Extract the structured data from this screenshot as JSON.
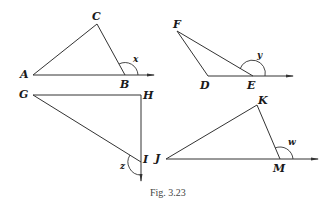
{
  "figure": {
    "caption": "Fig. 3.23",
    "triangles": [
      {
        "name": "ABC",
        "vertices": {
          "A": "A",
          "B": "B",
          "C": "C"
        },
        "exterior_angle": {
          "label": "x",
          "vertex": "B"
        }
      },
      {
        "name": "DEF",
        "vertices": {
          "D": "D",
          "E": "E",
          "F": "F"
        },
        "exterior_angle": {
          "label": "y",
          "vertex": "E"
        }
      },
      {
        "name": "GHI",
        "vertices": {
          "G": "G",
          "H": "H",
          "I": "I"
        },
        "exterior_angle": {
          "label": "z",
          "vertex": "I"
        }
      },
      {
        "name": "JKM",
        "vertices": {
          "J": "J",
          "K": "K",
          "M": "M"
        },
        "exterior_angle": {
          "label": "w",
          "vertex": "M"
        }
      }
    ]
  },
  "colors": {
    "stroke": "#333333",
    "text": "#1a1a1a",
    "background": "#ffffff"
  }
}
